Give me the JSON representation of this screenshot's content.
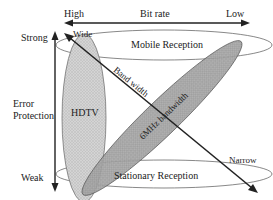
{
  "diagram": {
    "top_axis": {
      "left_label": "High",
      "center_label": "Bit rate",
      "right_label": "Low"
    },
    "left_axis": {
      "top_label": "Strong",
      "middle_label_line1": "Error",
      "middle_label_line2": "Protection",
      "bottom_label": "Weak"
    },
    "diagonal_axis": {
      "start_label": "Wide",
      "mid_label": "Band width",
      "end_label": "Narrow"
    },
    "regions": {
      "hdtv": "HDTV",
      "mobile": "Mobile Reception",
      "stationary": "Stationary Reception",
      "band_6mhz": "6MHz bandwidth"
    },
    "colors": {
      "hdtv_fill": "#c8c8c8",
      "band_fill": "#9a9a9a",
      "line": "#222222"
    }
  }
}
